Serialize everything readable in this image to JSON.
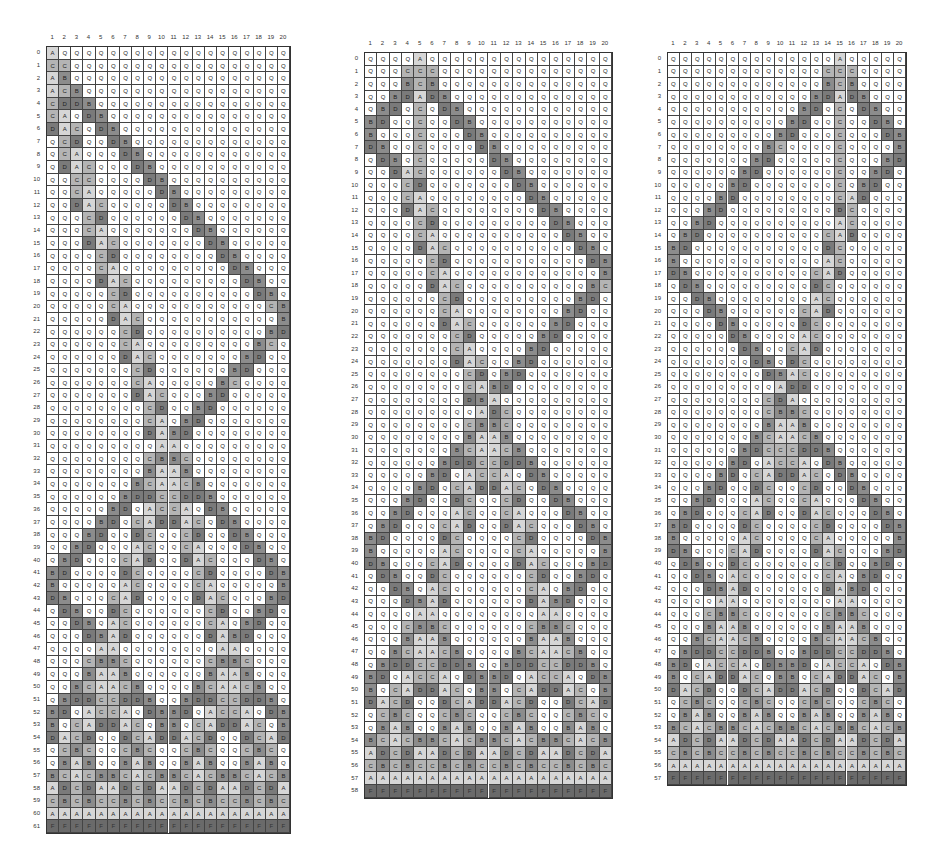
{
  "figure": {
    "states": [
      "Q",
      "A",
      "B",
      "C",
      "D",
      "F"
    ],
    "state_colors": {
      "Q": "#ffffff",
      "A": "#d6d6d6",
      "B": "#8c8c8c",
      "C": "#b4b4b4",
      "D": "#7a7a7a",
      "F": "#6a6a6a"
    },
    "column_labels": [
      "1",
      "2",
      "3",
      "4",
      "5",
      "6",
      "7",
      "8",
      "9",
      "10",
      "11",
      "12",
      "13",
      "14",
      "15",
      "16",
      "17",
      "18",
      "19",
      "20"
    ]
  },
  "panels": [
    {
      "id": "left",
      "general_position": 1,
      "row_count": 62,
      "firing_time": 61,
      "x": 26,
      "y": 34,
      "cell_w": 12.15,
      "cell_h": 12.68,
      "rows": [
        "AQQQQQQQQQQQQQQQQQQQ",
        "CCQQQQQQQQQQQQQQQQQQ",
        "ABQQQQQQQQQQQQQQQQQQ",
        "ACBQQQQQQQQQQQQQQQQQ",
        "CDDBQQQQQQQQQQQQQQQQ",
        "CAQDBQQQQQQQQQQQQQQQ",
        "DACQDBQQQQQQQQQQQQQQ",
        "QCDQQDBQQQQQQQQQQQQQ",
        "QCAQQQDBQQQQQQQQQQQQ",
        "QDACQQQDBQQQQQQQQQQQ",
        "QQCCQQQQDBQQQQQQQQQQ",
        "QQCAQQQQQDBQQQQQQQQQ",
        "QQDACQQQQQDBQQQQQQQQ",
        "QQQCDQQQQQQDBQQQQQQQ",
        "QQQCAQQQQQQQDBQQQQQQ",
        "QQQDACQQQQQQQDBQQQQQ",
        "QQQQCDQQQQQQQQDBQQQQ",
        "QQQQCAQQQQQQQQQDBQQQ",
        "QQQQDACQQQQQQQQQDBQQ",
        "QQQQQCDQQQQQQQQQQDBQ",
        "QQQQQCAQQQQQQQQQQQCB",
        "QQQQQDACQQQQQQQQQQQB",
        "QQQQQQCDQQQQQQQQQQBD",
        "QQQQQQCAQQQQQQQQQBCQ",
        "QQQQQQDACQQQQQQQBDQQ",
        "QQQQQQQCDQQQQQQBDQQQ",
        "QQQQQQQCAQQQQQBCQQQQ",
        "QQQQQQQDACQQQBDQQQQQ",
        "QQQQQQQQCDQQBDQQQQQQ",
        "QQQQQQQQCAQBDQQQQQQQ",
        "QQQQQQQQDABDQQQQQQQQ",
        "QQQQQQQQQAAQQQQQQQQQ",
        "QQQQQQQQCBBCQQQQQQQQ",
        "QQQQQQQQBAABQQQQQQQQ",
        "QQQQQQQBCAACBQQQQQQQ",
        "QQQQQQBDDCCDDBQQQQQQ",
        "QQQQQBDQACCAQDBQQQQQ",
        "QQQQBDQCADDACQDBQQQQ",
        "QQQBDQQDCQQCDQQDBQQQ",
        "QQBDQQQACQQCAQQQDBQQ",
        "QBDQQQCADQQDACQQQDBQ",
        "BDQQQQDCQQQQCDQQQQDB",
        "BQQQQQACQQQQCAQQQQQB",
        "DBQQQCADQQQQDACQQQBD",
        "QDBQQDCQQQQQQCDQQBDQ",
        "QQDBQACQQQQQQCAQBDQQ",
        "QQQDBADQQQQQQDABDQQQ",
        "QQQQAAQQQQQQQQAAQQQQ",
        "QQQCBBCQQQQQQCBBCQQQ",
        "QQQBAABQQQQQQBAABQQQ",
        "QQBCAACBQQQQBCAACBQQ",
        "QBDDCCDDBQQBDDCCDDBQ",
        "BDQACCAQDBBDQACCAQDB",
        "BQCADDACQBBQCADDACQB",
        "DACDQQDCADDACDQQDCAD",
        "QCBCQQCBCQQCBCQQCBCQ",
        "QBABQQBABQQBABQQBABQ",
        "BCACBBCACBBCACBBCACB",
        "ADCDAADCDAADCDAADCDA",
        "CBCBCCBCBCCBCBCCBCBC",
        "AAAAAAAAAAAAAAAAAAAA",
        "FFFFFFFFFFFFFFFFFFFF"
      ]
    },
    {
      "id": "middle",
      "general_position": 5,
      "row_count": 59,
      "firing_time": 58,
      "x": 344,
      "y": 40,
      "cell_w": 12.35,
      "cell_h": 12.62,
      "rows": [
        "QQQQAQQQQQQQQQQQQQQQ",
        "QQQCCCQQQQQQQQQQQQQQ",
        "QQQBCBQQQQQQQQQQQQQQ",
        "QQBDADBQQQQQQQQQQQQQ",
        "QBDQCQDBQQQQQQQQQQQQ",
        "BDQQCQQDBQQQQQQQQQQQ",
        "BQQQCQQQDBQQQQQQQQQQ",
        "DBQQCQQQQDBQQQQQQQQQ",
        "QDBQCQQQQQDBQQQQQQQQ",
        "QQDACQQQQQQDBQQQQQQQ",
        "QQQCDQQQQQQQDBQQQQQQ",
        "QQQCAQQQQQQQQDBQQQQQ",
        "QQQDACQQQQQQQQDBQQQQ",
        "QQQQCDQQQQQQQQQDBQQQ",
        "QQQQCAQQQQQQQQQQDBQQ",
        "QQQQDACQQQQQQQQQQDBQ",
        "QQQQQCDQQQQQQQQQQQDB",
        "QQQQQCAQQQQQQQQQQQQB",
        "QQQQQDACQQQQQQQQQQBC",
        "QQQQQQCDQQQQQQQQQBDQ",
        "QQQQQQCAQQQQQQQQBDQQ",
        "QQQQQQDACQQQQQQBDQQQ",
        "QQQQQQQCDQQQQQBDQQQQ",
        "QQQQQQQCAQQQQBDQQQQQ",
        "QQQQQQQDACQQBDQQQQQQ",
        "QQQQQQQQCDQBDQQQQQQQ",
        "QQQQQQQQCABDQQQQQQQQ",
        "QQQQQQQQDBAQQQQQQQQQ",
        "QQQQQQQQQADCQQQQQQQQ",
        "QQQQQQQQCBBCQQQQQQQQ",
        "QQQQQQQQBAABQQQQQQQQ",
        "QQQQQQQBCAACBQQQQQQQ",
        "QQQQQQBDDCCDDBQQQQQQ",
        "QQQQQBDQACCAQDBQQQQQ",
        "QQQQBDQCADDACQDBQQQQ",
        "QQQBDQQDCQQCDQQDBQQQ",
        "QQBDQQQACQQCAQQQDBQQ",
        "QBDQQQCADQQDACQQQDBQ",
        "BDQQQQDCQQQQCDQQQQDB",
        "BQQQQQACQQQQCAQQQQQB",
        "DBQQQCADQQQQDACQQQBD",
        "QDBQQDCQQQQQQCDQQBDQ",
        "QQDBQACQQQQQQCAQBDQQ",
        "QQQDBADQQQQQQDABDQQQ",
        "QQQQAAQQQQQQQQAAQQQQ",
        "QQQCBBCQQQQQQCBBCQQQ",
        "QQQBAABQQQQQQBAABQQQ",
        "QQBCAACBQQQQBCAACBQQ",
        "QBDDCCDDBQQBDDCCDDBQ",
        "BDQACCAQDBBDQACCAQDB",
        "BQCADDACQBBQCADDACQB",
        "DACDQQDCADDACDQQDCAD",
        "QCBCQQCBCQQCBCQQCBCQ",
        "QBABQQBABQQBABQQBABQ",
        "BCACBBCACBBCACBBCACB",
        "ADCDAADCDAADCDAADCDA",
        "CBCBCCBCBCCBCBCCBCBC",
        "AAAAAAAAAAAAAAAAAAAA",
        "FFFFFFFFFFFFFFFFFFFF"
      ]
    },
    {
      "id": "right",
      "general_position": 15,
      "row_count": 58,
      "firing_time": 57,
      "x": 647,
      "y": 40,
      "cell_w": 11.9,
      "cell_h": 12.62,
      "rows": [
        "QQQQQQQQQQQQQQAQQQQQ",
        "QQQQQQQQQQQQQCCCQQQQ",
        "QQQQQQQQQQQQQBCBQQQQ",
        "QQQQQQQQQQQQBDADBQQQ",
        "QQQQQQQQQQQBDQCQDBQQ",
        "QQQQQQQQQQBDQQCQQDBQ",
        "QQQQQQQQQBDQQQCQQQDB",
        "QQQQQQQQBCQQQQCQQQQB",
        "QQQQQQQBDQQQQQCQQQBD",
        "QQQQQQBDQQQQQQCQQBDQ",
        "QQQQQBDQQQQQQQCQBDQQ",
        "QQQQBDQQQQQQQQCADQQQ",
        "QQQBDQQQQQQQQQDCQQQQ",
        "QQBDQQQQQQQQQQACQQQQ",
        "QBDQQQQQQQQQQCADQQQQ",
        "BDQQQQQQQQQQQDCQQQQQ",
        "BQQQQQQQQQQQQACQQQQQ",
        "DBQQQQQQQQQQCADQQQQQ",
        "QDBQQQQQQQQQDCQQQQQQ",
        "QQDBQQQQQQQQACQQQQQQ",
        "QQQDBQQQQQQCADQQQQQQ",
        "QQQQDBQQQQQDCQQQQQQQ",
        "QQQQQDBQQQQACQQQQQQQ",
        "QQQQQQDBQQCADQQQQQQQ",
        "QQQQQQQDBQDCQQQQQQQQ",
        "QQQQQQQQDBACQQQQQQQQ",
        "QQQQQQQQQADDQQQQQQQQ",
        "QQQQQQQQCDAQQQQQQQQQ",
        "QQQQQQQQCBBCQQQQQQQQ",
        "QQQQQQQQBAABQQQQQQQQ",
        "QQQQQQQBCAACBQQQQQQQ",
        "QQQQQQBDCCCDDBQQQQQQ",
        "QQQQQBDQACCAQDBQQQQQ",
        "QQQQBDQCADDACQDBQQQQ",
        "QQQBDQQDCQQCDQQDBQQQ",
        "QQBDQQQACQQCAQQQDBQQ",
        "QBDQQQCADQQDACQQQDBQ",
        "BDQQQQDCQQQQCDQQQQDB",
        "BQQQQQACQQQQCAQQQQQB",
        "DBQQQCADQQQQDACQQQBD",
        "QDBQQDCQQQQQQCDQQBDQ",
        "QQDBQACQQQQQQCAQBDQQ",
        "QQQDBADQQQQQQDABDQQQ",
        "QQQQAAQQQQQQQQAAQQQQ",
        "QQQCBBCQQQQQQCBBCQQQ",
        "QQQBAABQQQQQQBAABQQQ",
        "QQBCAACBQQQQBCAACBQQ",
        "QBDDCCDDBQQBDDCCDDBQ",
        "BDQACCAQDBBDQACCAQDB",
        "BQCADDACQBBQCADDACQB",
        "DACDQQDCADDACDQQDCAD",
        "QCBCQQCBCQQCBCQQCBCQ",
        "QBABQQBABQQBABQQBABQ",
        "BCACBBCACBBCACBBCACB",
        "ADCDAADCDAADCDAADCDA",
        "CBCBCCBCBCCBCBCCBCBC",
        "AAAAAAAAAAAAAAAAAAAA",
        "FFFFFFFFFFFFFFFFFFFF"
      ]
    }
  ]
}
